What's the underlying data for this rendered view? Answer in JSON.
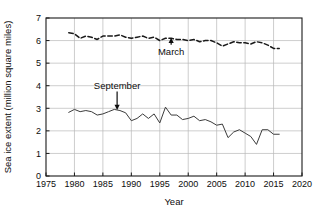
{
  "chart_data": {
    "type": "line",
    "title": "",
    "xlabel": "Year",
    "ylabel": "Sea ice extent (million square miles)",
    "xlim": [
      1975,
      2020
    ],
    "ylim": [
      0,
      7
    ],
    "xticks": [
      1975,
      1980,
      1985,
      1990,
      1995,
      2000,
      2005,
      2010,
      2015,
      2020
    ],
    "yticks": [
      0,
      1,
      2,
      3,
      4,
      5,
      6,
      7
    ],
    "grid": true,
    "legend_position": "inline-annotations",
    "series": [
      {
        "name": "March",
        "style": "dashed",
        "color": "#1a1a1a",
        "x": [
          1979,
          1980,
          1981,
          1982,
          1983,
          1984,
          1985,
          1986,
          1987,
          1988,
          1989,
          1990,
          1991,
          1992,
          1993,
          1994,
          1995,
          1996,
          1997,
          1998,
          1999,
          2000,
          2001,
          2002,
          2003,
          2004,
          2005,
          2006,
          2007,
          2008,
          2009,
          2010,
          2011,
          2012,
          2013,
          2014,
          2015,
          2016
        ],
        "values": [
          6.35,
          6.3,
          6.1,
          6.2,
          6.15,
          6.05,
          6.2,
          6.2,
          6.2,
          6.25,
          6.15,
          6.1,
          6.15,
          6.2,
          6.1,
          6.15,
          6.0,
          6.1,
          6.1,
          6.05,
          6.05,
          6.0,
          6.05,
          5.95,
          6.0,
          6.0,
          5.9,
          5.75,
          5.85,
          5.95,
          5.9,
          5.9,
          5.85,
          5.95,
          5.9,
          5.8,
          5.65,
          5.65
        ]
      },
      {
        "name": "September",
        "style": "solid",
        "color": "#3b3b3b",
        "x": [
          1979,
          1980,
          1981,
          1982,
          1983,
          1984,
          1985,
          1986,
          1987,
          1988,
          1989,
          1990,
          1991,
          1992,
          1993,
          1994,
          1995,
          1996,
          1997,
          1998,
          1999,
          2000,
          2001,
          2002,
          2003,
          2004,
          2005,
          2006,
          2007,
          2008,
          2009,
          2010,
          2011,
          2012,
          2013,
          2014,
          2015,
          2016
        ],
        "values": [
          2.82,
          2.95,
          2.85,
          2.9,
          2.85,
          2.7,
          2.75,
          2.85,
          2.95,
          2.9,
          2.8,
          2.45,
          2.55,
          2.75,
          2.55,
          2.75,
          2.35,
          3.05,
          2.7,
          2.7,
          2.5,
          2.55,
          2.65,
          2.45,
          2.5,
          2.4,
          2.25,
          2.3,
          1.7,
          1.95,
          2.05,
          1.9,
          1.75,
          1.4,
          2.05,
          2.05,
          1.85,
          1.85
        ]
      }
    ],
    "annotations": [
      {
        "text": "March",
        "series": "March",
        "x_year": 1997,
        "label_x": 1997,
        "label_y": 5.35,
        "arrow_direction": "up",
        "target_y": 6.1
      },
      {
        "text": "September",
        "series": "September",
        "x_year": 1987.5,
        "label_x": 1987.5,
        "label_y": 3.85,
        "arrow_direction": "down",
        "target_y": 2.95
      }
    ]
  },
  "colors": {
    "background": "#ffffff",
    "frame": "#1a1a1a",
    "grid": "#b8b8b8",
    "march_line": "#1a1a1a",
    "september_line": "#3b3b3b",
    "text": "#0d0d0d"
  }
}
